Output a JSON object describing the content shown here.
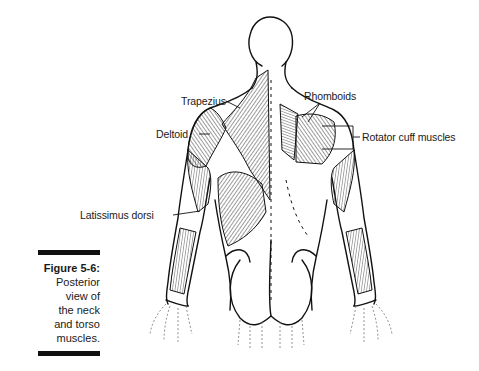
{
  "figure": {
    "number_label": "Figure 5-6:",
    "caption_lines": [
      "Posterior",
      "view of",
      "the neck",
      "and torso",
      "muscles."
    ]
  },
  "labels": {
    "trapezius": "Trapezius",
    "rhomboids": "Rhomboids",
    "deltoid": "Deltoid",
    "rotator_cuff": "Rotator cuff muscles",
    "latissimus": "Latissimus dorsi"
  },
  "colors": {
    "ink": "#1a1a1a",
    "background": "#ffffff",
    "rule": "#111111"
  }
}
